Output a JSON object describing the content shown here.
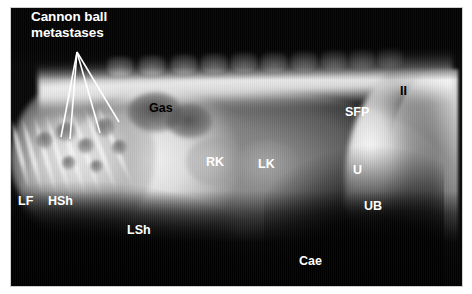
{
  "figure": {
    "modality": "radiograph",
    "view": "lateral abdomen",
    "frame_color": "#cfcfcf",
    "background_color": "#ffffff"
  },
  "callout": {
    "name": "cannon-ball-metastases-callout",
    "line1": "Cannon ball",
    "line2": "metastases",
    "color": "#ffffff",
    "leader_origin": {
      "x": 77,
      "y": 52
    },
    "leader_ends": [
      {
        "x": 61,
        "y": 137
      },
      {
        "x": 70,
        "y": 139
      },
      {
        "x": 100,
        "y": 133
      },
      {
        "x": 119,
        "y": 122
      }
    ]
  },
  "labels": [
    {
      "id": "gas",
      "text": "Gas",
      "color": "#000000",
      "x": 149,
      "y": 101
    },
    {
      "id": "sfp",
      "text": "SFP",
      "color": "#ffffff",
      "x": 345,
      "y": 105
    },
    {
      "id": "ii",
      "text": "II",
      "color": "#000000",
      "x": 400,
      "y": 84
    },
    {
      "id": "rk",
      "text": "RK",
      "color": "#ffffff",
      "x": 206,
      "y": 155
    },
    {
      "id": "lk",
      "text": "LK",
      "color": "#ffffff",
      "x": 258,
      "y": 157
    },
    {
      "id": "u",
      "text": "U",
      "color": "#ffffff",
      "x": 353,
      "y": 163
    },
    {
      "id": "ub",
      "text": "UB",
      "color": "#ffffff",
      "x": 364,
      "y": 199
    },
    {
      "id": "lf",
      "text": "LF",
      "color": "#ffffff",
      "x": 18,
      "y": 194
    },
    {
      "id": "hsh",
      "text": "HSh",
      "color": "#ffffff",
      "x": 48,
      "y": 194
    },
    {
      "id": "lsh",
      "text": "LSh",
      "color": "#ffffff",
      "x": 127,
      "y": 223
    },
    {
      "id": "cae",
      "text": "Cae",
      "color": "#ffffff",
      "x": 299,
      "y": 254
    }
  ],
  "anatomy": {
    "vertebrae_x": [
      120,
      152,
      184,
      214,
      244,
      274,
      304,
      334,
      362,
      390
    ],
    "ribs": [
      {
        "x": 18,
        "y": 118,
        "h": 74,
        "rot": -14
      },
      {
        "x": 30,
        "y": 116,
        "h": 80,
        "rot": -15
      },
      {
        "x": 43,
        "y": 114,
        "h": 84,
        "rot": -16
      },
      {
        "x": 56,
        "y": 112,
        "h": 88,
        "rot": -17
      },
      {
        "x": 70,
        "y": 110,
        "h": 90,
        "rot": -18
      },
      {
        "x": 84,
        "y": 108,
        "h": 92,
        "rot": -19
      },
      {
        "x": 98,
        "y": 104,
        "h": 92,
        "rot": -21
      },
      {
        "x": 112,
        "y": 100,
        "h": 90,
        "rot": -24
      }
    ],
    "nodules": [
      {
        "x": 36,
        "y": 132,
        "d": 17
      },
      {
        "x": 56,
        "y": 122,
        "d": 20
      },
      {
        "x": 78,
        "y": 138,
        "d": 16
      },
      {
        "x": 96,
        "y": 118,
        "d": 19
      },
      {
        "x": 112,
        "y": 140,
        "d": 15
      },
      {
        "x": 62,
        "y": 156,
        "d": 14
      },
      {
        "x": 90,
        "y": 160,
        "d": 13
      }
    ],
    "gas_pockets": [
      {
        "x": 128,
        "y": 92,
        "w": 54,
        "h": 40
      },
      {
        "x": 166,
        "y": 104,
        "w": 46,
        "h": 34
      }
    ],
    "kidneys": [
      {
        "id": "right-kidney",
        "x": 186,
        "y": 138,
        "w": 58,
        "h": 48
      },
      {
        "id": "left-kidney",
        "x": 236,
        "y": 140,
        "w": 62,
        "h": 50
      }
    ],
    "bladder": {
      "x": 344,
      "y": 182,
      "w": 46,
      "h": 40
    },
    "bowel": [
      {
        "x": 276,
        "y": 236,
        "w": 34,
        "h": 26
      },
      {
        "x": 318,
        "y": 228,
        "w": 30,
        "h": 24
      },
      {
        "x": 222,
        "y": 222,
        "w": 40,
        "h": 30
      }
    ]
  }
}
